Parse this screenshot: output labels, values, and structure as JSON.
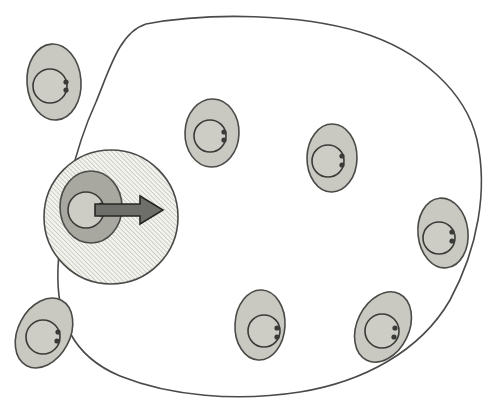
{
  "figure": {
    "title": "Cell migration diagram",
    "background_color": "#ffffff",
    "width": 499,
    "height": 411
  },
  "tissue_outline": {
    "name": "tissue-boundary",
    "stroke_color": "#4a4a48",
    "stroke_width": 1.6,
    "fill": "none",
    "path": "M 146 24 C 210 12, 300 14, 360 32 C 420 50, 466 92, 477 140 C 488 190, 478 248, 450 300 C 420 352, 362 382, 300 392 C 236 402, 170 396, 120 376 C 72 356, 56 318, 58 268 C 60 212, 74 150, 96 102 C 110 68, 120 32, 146 24 Z"
  },
  "hatched_zone": {
    "name": "hatched-circle",
    "cx": 111,
    "cy": 217,
    "r": 67,
    "stroke_color": "#4a4a48",
    "stroke_width": 1.6,
    "fill_base": "#f3f3ee",
    "hatch_color": "#b9b9b2",
    "hatch_angle": "45deg-up",
    "hatch_spacing": 3.2
  },
  "arrow": {
    "name": "migration-arrow",
    "direction": "right",
    "x_start": 95,
    "x_end": 163,
    "y": 210,
    "shaft_half_height": 6,
    "head_half_height": 14,
    "head_length": 23,
    "fill_color": "#6e6e6a",
    "stroke_color": "#262624",
    "stroke_width": 1.6
  },
  "cell_style": {
    "cytoplasm_fill": "#c9c9c1",
    "cytoplasm_stroke": "#4a4a48",
    "cytoplasm_stroke_width": 1.6,
    "nucleus_fill": "#cdcdc5",
    "nucleus_stroke": "#3a3a38",
    "nucleus_stroke_width": 1.6,
    "granule_fill": "#3a3a38",
    "highlight_cytoplasm_fill": "#a8a8a0"
  },
  "cells": [
    {
      "id": "cell-top-left",
      "label": "Top left cell",
      "cx": 54,
      "cy": 82,
      "rx": 27,
      "ry": 38,
      "rotation": -4,
      "nucleus_cx": 50,
      "nucleus_cy": 86,
      "nucleus_r": 17,
      "granules": [
        [
          66,
          82,
          2.6
        ],
        [
          66,
          90,
          2.6
        ]
      ],
      "highlighted": false
    },
    {
      "id": "cell-migrating",
      "label": "Migrating cell in hatched zone",
      "cx": 91,
      "cy": 207,
      "rx": 31,
      "ry": 36,
      "rotation": 0,
      "nucleus_cx": 86,
      "nucleus_cy": 210,
      "nucleus_r": 18,
      "granules": [
        [
          101,
          205,
          2.6
        ],
        [
          101,
          214,
          2.6
        ]
      ],
      "highlighted": true
    },
    {
      "id": "cell-upper-middle",
      "label": "Upper middle cell",
      "cx": 212,
      "cy": 133,
      "rx": 27,
      "ry": 34,
      "rotation": 2,
      "nucleus_cx": 210,
      "nucleus_cy": 136,
      "nucleus_r": 16,
      "granules": [
        [
          224,
          132,
          2.6
        ],
        [
          224,
          140,
          2.6
        ]
      ],
      "highlighted": false
    },
    {
      "id": "cell-upper-right",
      "label": "Upper right cell",
      "cx": 332,
      "cy": 158,
      "rx": 25,
      "ry": 34,
      "rotation": 1,
      "nucleus_cx": 328,
      "nucleus_cy": 161,
      "nucleus_r": 16,
      "granules": [
        [
          342,
          156,
          2.6
        ],
        [
          342,
          165,
          2.6
        ]
      ],
      "highlighted": false
    },
    {
      "id": "cell-right",
      "label": "Right edge cell",
      "cx": 443,
      "cy": 233,
      "rx": 25,
      "ry": 35,
      "rotation": -6,
      "nucleus_cx": 439,
      "nucleus_cy": 238,
      "nucleus_r": 16,
      "granules": [
        [
          452,
          232,
          2.6
        ],
        [
          452,
          241,
          2.6
        ]
      ],
      "highlighted": false
    },
    {
      "id": "cell-bottom-left",
      "label": "Bottom left cell",
      "cx": 44,
      "cy": 333,
      "rx": 26,
      "ry": 37,
      "rotation": 28,
      "nucleus_cx": 43,
      "nucleus_cy": 337,
      "nucleus_r": 17,
      "granules": [
        [
          58,
          332,
          2.6
        ],
        [
          57,
          341,
          2.6
        ]
      ],
      "highlighted": false
    },
    {
      "id": "cell-bottom-middle",
      "label": "Bottom middle cell",
      "cx": 260,
      "cy": 325,
      "rx": 25,
      "ry": 35,
      "rotation": 3,
      "nucleus_cx": 264,
      "nucleus_cy": 331,
      "nucleus_r": 16,
      "granules": [
        [
          277,
          328,
          2.6
        ],
        [
          277,
          337,
          2.6
        ]
      ],
      "highlighted": false
    },
    {
      "id": "cell-bottom-right",
      "label": "Bottom right cell",
      "cx": 383,
      "cy": 327,
      "rx": 26,
      "ry": 37,
      "rotation": 26,
      "nucleus_cx": 382,
      "nucleus_cy": 331,
      "nucleus_r": 17,
      "granules": [
        [
          395,
          328,
          2.6
        ],
        [
          394,
          337,
          2.6
        ]
      ],
      "highlighted": false
    },
    {
      "id": "cell-middle-right-lower",
      "label": "Lower right inner cell",
      "cx": 253,
      "cy": 326,
      "rx": 0,
      "ry": 0,
      "rotation": 0,
      "nucleus_cx": 0,
      "nucleus_cy": 0,
      "nucleus_r": 0,
      "granules": [],
      "highlighted": false,
      "hidden": true
    }
  ]
}
